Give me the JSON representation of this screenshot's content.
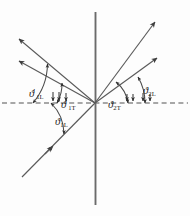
{
  "figure": {
    "type": "ray-diagram",
    "title": "",
    "background_color": "#fdfdfd",
    "line_color": "#4a4a4a",
    "text_color": "#1a1a1a",
    "origin": {
      "x": 95,
      "y": 103
    },
    "axes": {
      "vertical_line": {
        "x": 95.5,
        "y1": 12,
        "y2": 205,
        "style": "solid",
        "color": "#6b6b6b"
      },
      "interface_line": {
        "y": 103,
        "x1": 2,
        "x2": 188,
        "style": "dashed",
        "color": "#8a8a8a"
      }
    },
    "rays": [
      {
        "name": "reflected-longitudinal",
        "from": [
          95,
          103
        ],
        "to": [
          18,
          38
        ],
        "arrow": "end"
      },
      {
        "name": "reflected-transverse",
        "from": [
          95,
          103
        ],
        "to": [
          18,
          60
        ],
        "arrow": "end"
      },
      {
        "name": "transmitted-longitudinal",
        "from": [
          95,
          103
        ],
        "to": [
          156,
          21
        ],
        "arrow": "end"
      },
      {
        "name": "transmitted-transverse",
        "from": [
          95,
          103
        ],
        "to": [
          158,
          57
        ],
        "arrow": "end"
      },
      {
        "name": "incident-longitudinal",
        "from": [
          22,
          177
        ],
        "to": [
          95,
          103
        ],
        "arrow": "mid"
      },
      {
        "name": "incident-continuation",
        "from": [
          95,
          103
        ],
        "to": [
          172,
          103
        ],
        "arrow": "none"
      }
    ],
    "angle_arcs": [
      {
        "name": "arc-theta-1L-prime",
        "radius": 62,
        "from_deg": 140,
        "to_deg": 180,
        "arrows": "both"
      },
      {
        "name": "arc-theta-1T-prime",
        "radius": 38,
        "from_deg": 150,
        "to_deg": 180,
        "arrows": "both"
      },
      {
        "name": "arc-theta-1L",
        "radius": 44,
        "from_deg": 180,
        "to_deg": 225,
        "arrows": "both"
      },
      {
        "name": "arc-theta-2T",
        "radius": 50,
        "from_deg": 0,
        "to_deg": 30,
        "arrows": "both"
      },
      {
        "name": "arc-theta-2L",
        "radius": 33,
        "from_deg": 0,
        "to_deg": 53,
        "arrows": "both"
      }
    ],
    "labels": {
      "reflected_longitudinal": {
        "symbol": "ϑ",
        "prime": "′",
        "subscript": "1L"
      },
      "reflected_transverse": {
        "symbol": "ϑ",
        "prime": "′",
        "subscript": "1T"
      },
      "incident_longitudinal": {
        "symbol": "ϑ",
        "prime": "",
        "subscript": "1L"
      },
      "transmitted_transverse": {
        "symbol": "ϑ",
        "prime": "",
        "subscript": "2T"
      },
      "transmitted_longitudinal": {
        "symbol": "ϑ",
        "prime": "",
        "subscript": "2L"
      }
    }
  }
}
